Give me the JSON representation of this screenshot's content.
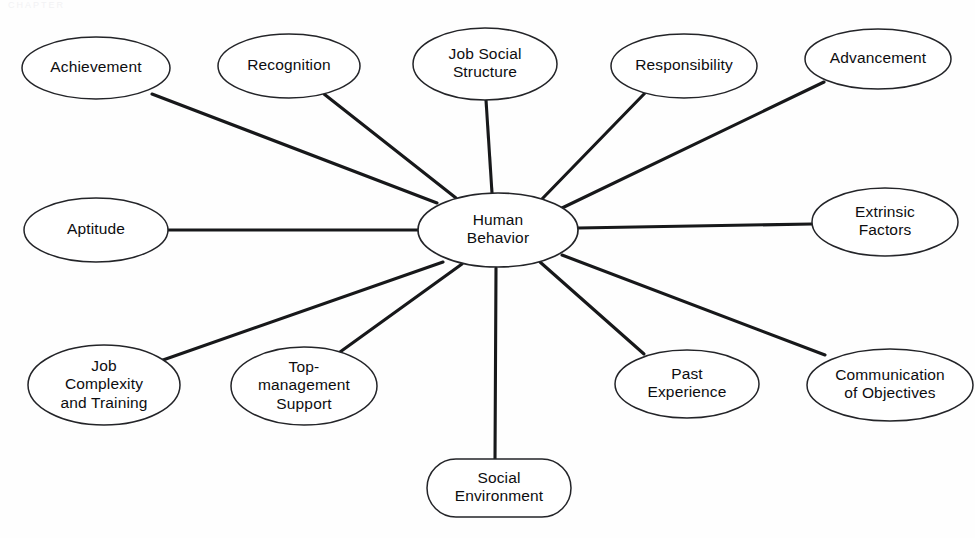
{
  "page": {
    "width": 975,
    "height": 538,
    "background_color": "#fefefe",
    "header_ghost_text": "CHAPTER"
  },
  "diagram": {
    "type": "radial-spoke",
    "line_color": "#17181a",
    "node_fill": "#ffffff",
    "node_stroke": "#232428",
    "text_color": "#0d0d0f",
    "center": {
      "id": "human-behavior",
      "label": "Human Behavior",
      "lines": [
        "Human",
        "Behavior"
      ],
      "shape": "ellipse",
      "cx": 498,
      "cy": 230,
      "rx": 80,
      "ry": 37
    },
    "nodes": [
      {
        "id": "achievement",
        "label": "Achievement",
        "lines": [
          "Achievement"
        ],
        "shape": "ellipse",
        "cx": 96,
        "cy": 68,
        "rx": 74,
        "ry": 31,
        "edge_from": [
          152,
          94
        ],
        "edge_to": [
          437,
          203
        ]
      },
      {
        "id": "recognition",
        "label": "Recognition",
        "lines": [
          "Recognition"
        ],
        "shape": "ellipse",
        "cx": 289,
        "cy": 66,
        "rx": 71,
        "ry": 32,
        "edge_from": [
          324,
          94
        ],
        "edge_to": [
          456,
          198
        ]
      },
      {
        "id": "job-social-structure",
        "label": "Job Social Structure",
        "lines": [
          "Job Social",
          "Structure"
        ],
        "shape": "ellipse",
        "cx": 485,
        "cy": 64,
        "rx": 72,
        "ry": 36,
        "edge_from": [
          486,
          100
        ],
        "edge_to": [
          492,
          193
        ]
      },
      {
        "id": "responsibility",
        "label": "Responsibility",
        "lines": [
          "Responsibility"
        ],
        "shape": "ellipse",
        "cx": 684,
        "cy": 66,
        "rx": 73,
        "ry": 32,
        "edge_from": [
          645,
          93
        ],
        "edge_to": [
          542,
          199
        ]
      },
      {
        "id": "advancement",
        "label": "Advancement",
        "lines": [
          "Advancement"
        ],
        "shape": "ellipse",
        "cx": 878,
        "cy": 59,
        "rx": 73,
        "ry": 30,
        "edge_from": [
          824,
          82
        ],
        "edge_to": [
          562,
          208
        ]
      },
      {
        "id": "aptitude",
        "label": "Aptitude",
        "lines": [
          "Aptitude"
        ],
        "shape": "ellipse",
        "cx": 96,
        "cy": 230,
        "rx": 72,
        "ry": 32,
        "edge_from": [
          168,
          230
        ],
        "edge_to": [
          418,
          230
        ]
      },
      {
        "id": "extrinsic-factors",
        "label": "Extrinsic Factors",
        "lines": [
          "Extrinsic",
          "Factors"
        ],
        "shape": "ellipse",
        "cx": 885,
        "cy": 222,
        "rx": 73,
        "ry": 34,
        "edge_from": [
          812,
          224
        ],
        "edge_to": [
          578,
          228
        ]
      },
      {
        "id": "job-complexity-and-training",
        "label": "Job Complexity and Training",
        "lines": [
          "Job",
          "Complexity",
          "and Training"
        ],
        "shape": "ellipse",
        "cx": 104,
        "cy": 385,
        "rx": 76,
        "ry": 40,
        "edge_from": [
          163,
          360
        ],
        "edge_to": [
          443,
          262
        ]
      },
      {
        "id": "top-management-support",
        "label": "Top-management Support",
        "lines": [
          "Top-",
          "management",
          "Support"
        ],
        "shape": "ellipse",
        "cx": 304,
        "cy": 386,
        "rx": 73,
        "ry": 39,
        "edge_from": [
          340,
          352
        ],
        "edge_to": [
          462,
          264
        ]
      },
      {
        "id": "social-environment",
        "label": "Social Environment",
        "lines": [
          "Social",
          "Environment"
        ],
        "shape": "rounded-rect",
        "cx": 499,
        "cy": 488,
        "rx": 72,
        "ry": 29,
        "edge_from": [
          495,
          459
        ],
        "edge_to": [
          496,
          268
        ]
      },
      {
        "id": "past-experience",
        "label": "Past Experience",
        "lines": [
          "Past",
          "Experience"
        ],
        "shape": "ellipse",
        "cx": 687,
        "cy": 384,
        "rx": 72,
        "ry": 34,
        "edge_from": [
          644,
          354
        ],
        "edge_to": [
          540,
          262
        ]
      },
      {
        "id": "communication-of-objectives",
        "label": "Communication of Objectives",
        "lines": [
          "Communication",
          "of Objectives"
        ],
        "shape": "ellipse",
        "cx": 890,
        "cy": 385,
        "rx": 83,
        "ry": 36,
        "edge_from": [
          825,
          355
        ],
        "edge_to": [
          562,
          255
        ]
      }
    ]
  }
}
